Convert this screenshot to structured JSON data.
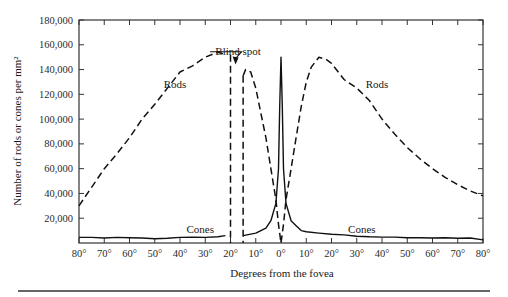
{
  "chart_data": {
    "type": "line",
    "title": "",
    "xlabel": "Degrees from the fovea",
    "ylabel": "Number of rods or cones per mm²",
    "x_tick_labels": [
      "80°",
      "70°",
      "60°",
      "50°",
      "40°",
      "30°",
      "20°",
      "10°",
      "0°",
      "10°",
      "20°",
      "30°",
      "40°",
      "50°",
      "60°",
      "70°",
      "80°"
    ],
    "x_range": [
      -80,
      80
    ],
    "y_tick_labels": [
      "20,000",
      "40,000",
      "60,000",
      "80,000",
      "100,000",
      "120,000",
      "140,000",
      "160,000",
      "180,000"
    ],
    "ylim": [
      0,
      180000
    ],
    "grid": false,
    "legend": "none (inline labels)",
    "annotations": [
      {
        "text": "Blind spot",
        "x": -17,
        "y": 152000,
        "arrow_to": [
          -18,
          144000
        ]
      },
      {
        "text": "Rods",
        "x": -42,
        "y": 125000
      },
      {
        "text": "Rods",
        "x": 38,
        "y": 125000
      },
      {
        "text": "Cones",
        "x": -32,
        "y": 8000
      },
      {
        "text": "Cones",
        "x": 32,
        "y": 8000
      }
    ],
    "series": [
      {
        "name": "Rods",
        "style": "dashed",
        "x": [
          -80,
          -75,
          -70,
          -65,
          -60,
          -55,
          -50,
          -45,
          -40,
          -35,
          -30,
          -25,
          -22,
          -20,
          -15,
          -14,
          -12,
          -10,
          -8,
          -6,
          -4,
          -2,
          -1,
          0,
          1,
          2,
          4,
          6,
          8,
          10,
          12,
          15,
          18,
          20,
          25,
          30,
          35,
          40,
          45,
          50,
          55,
          60,
          65,
          70,
          75,
          80
        ],
        "y": [
          30000,
          45000,
          60000,
          72000,
          85000,
          100000,
          112000,
          125000,
          138000,
          143000,
          150000,
          154000,
          152000,
          0,
          135000,
          140000,
          138000,
          125000,
          105000,
          85000,
          60000,
          35000,
          15000,
          0,
          15000,
          35000,
          60000,
          85000,
          110000,
          130000,
          142000,
          150000,
          148000,
          145000,
          132000,
          125000,
          115000,
          100000,
          88000,
          77000,
          68000,
          60000,
          53000,
          47000,
          42000,
          38000
        ]
      },
      {
        "name": "Cones",
        "style": "solid",
        "x": [
          -80,
          -75,
          -70,
          -65,
          -60,
          -55,
          -50,
          -45,
          -40,
          -35,
          -30,
          -25,
          -22,
          -20,
          -15,
          -10,
          -6,
          -4,
          -2,
          -1,
          -0.5,
          0,
          0.5,
          1,
          2,
          4,
          6,
          8,
          10,
          15,
          20,
          25,
          30,
          35,
          40,
          45,
          50,
          55,
          60,
          65,
          70,
          75,
          80
        ],
        "y": [
          4500,
          4500,
          4000,
          4500,
          4200,
          4000,
          3500,
          3800,
          4500,
          4800,
          4500,
          5000,
          6000,
          0,
          6000,
          8000,
          12000,
          18000,
          32000,
          60000,
          110000,
          150000,
          110000,
          60000,
          32000,
          18000,
          14000,
          10000,
          9000,
          8000,
          7000,
          6500,
          5500,
          5000,
          4800,
          4800,
          4200,
          4300,
          4000,
          4200,
          3800,
          4000,
          2500
        ]
      }
    ],
    "blind_spot_range_deg": [
      -20,
      -15
    ]
  }
}
